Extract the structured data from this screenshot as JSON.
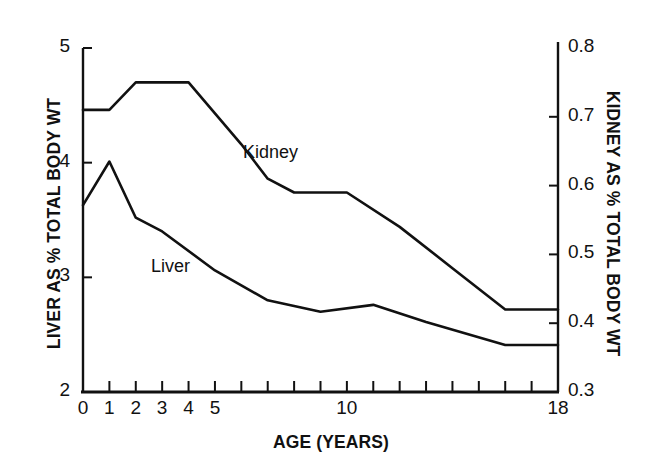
{
  "chart_data": {
    "type": "line",
    "title": "",
    "xlabel": "AGE (YEARS)",
    "ylabel_left": "LIVER AS % TOTAL BODY WT",
    "ylabel_right": "KIDNEY AS % TOTAL BODY WT",
    "xlim": [
      0,
      18
    ],
    "ylim_left": [
      2,
      5
    ],
    "ylim_right": [
      0.3,
      0.8
    ],
    "grid": false,
    "legend_position": "inline-annotations",
    "x_ticks_major": [
      0,
      1,
      2,
      3,
      4,
      5,
      10,
      18
    ],
    "x_ticks_minor": [
      0,
      1,
      2,
      3,
      4,
      5,
      6,
      7,
      8,
      9,
      10,
      11,
      12,
      13,
      14,
      15,
      16,
      17,
      18
    ],
    "x_tick_labels": [
      "0",
      "1",
      "2",
      "3",
      "4",
      "5",
      "10",
      "18"
    ],
    "y_ticks_left": [
      2,
      3,
      4,
      5
    ],
    "y_tick_labels_left": [
      "2",
      "3",
      "4",
      "5"
    ],
    "y_ticks_right": [
      0.3,
      0.4,
      0.5,
      0.6,
      0.7,
      0.8
    ],
    "y_tick_labels_right": [
      "0.3",
      "0.4",
      "0.5",
      "0.6",
      "0.7",
      "0.8"
    ],
    "line_color": "#111111",
    "series": [
      {
        "name": "Liver",
        "axis": "left",
        "label": "Liver",
        "x": [
          0,
          1,
          2,
          3,
          5,
          7,
          9,
          11,
          13,
          16,
          18
        ],
        "values": [
          3.63,
          4.01,
          3.52,
          3.4,
          3.06,
          2.8,
          2.7,
          2.76,
          2.61,
          2.41,
          2.41
        ]
      },
      {
        "name": "Kidney",
        "axis": "right",
        "label": "Kidney",
        "x": [
          0,
          1,
          2,
          4,
          6,
          7,
          8,
          10,
          12,
          14,
          16,
          18
        ],
        "values": [
          0.71,
          0.71,
          0.75,
          0.75,
          0.66,
          0.61,
          0.59,
          0.59,
          0.54,
          0.48,
          0.42,
          0.42
        ]
      }
    ]
  }
}
